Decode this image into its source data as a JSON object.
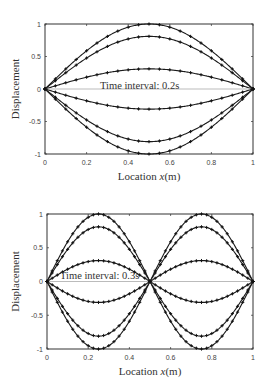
{
  "chart_data": [
    {
      "type": "line",
      "title": "",
      "annotation": "Time interval: 0.2s",
      "xlabel": "Location x(m)",
      "ylabel": "Displacement",
      "xlim": [
        0,
        1
      ],
      "ylim": [
        -1,
        1
      ],
      "xticks": [
        "0",
        "0.2",
        "0.4",
        "0.6",
        "0.8",
        "1"
      ],
      "yticks": [
        "-1",
        "-0.5",
        "0",
        "0.5",
        "1"
      ],
      "grid": false,
      "legend": null,
      "mode": 1,
      "function": "A*sin(pi*x)",
      "marker": "+",
      "series": [
        {
          "name": "t=0.0s",
          "amplitude": 1.0
        },
        {
          "name": "t=0.2s",
          "amplitude": 0.81
        },
        {
          "name": "t=0.4s",
          "amplitude": 0.31
        },
        {
          "name": "t=0.5s",
          "amplitude": 0.0
        },
        {
          "name": "t=0.6s",
          "amplitude": -0.31
        },
        {
          "name": "t=0.8s",
          "amplitude": -0.81
        },
        {
          "name": "t=1.0s",
          "amplitude": -1.0
        }
      ],
      "x": [
        0,
        0.05,
        0.1,
        0.15,
        0.2,
        0.25,
        0.3,
        0.35,
        0.4,
        0.45,
        0.5,
        0.55,
        0.6,
        0.65,
        0.7,
        0.75,
        0.8,
        0.85,
        0.9,
        0.95,
        1.0
      ]
    },
    {
      "type": "line",
      "title": "",
      "annotation": "Time interval: 0.3s",
      "xlabel": "Location x(m)",
      "ylabel": "Displacement",
      "xlim": [
        0,
        1
      ],
      "ylim": [
        -1,
        1
      ],
      "xticks": [
        "0",
        "0.2",
        "0.4",
        "0.6",
        "0.8",
        "1"
      ],
      "yticks": [
        "-1",
        "-0.5",
        "0",
        "0.5",
        "1"
      ],
      "grid": false,
      "legend": null,
      "mode": 2,
      "function": "A*sin(2*pi*x)",
      "marker": "+",
      "series": [
        {
          "name": "t=0.0s",
          "amplitude": 1.0
        },
        {
          "name": "t=0.3s",
          "amplitude": 0.81
        },
        {
          "name": "t=0.6s",
          "amplitude": 0.31
        },
        {
          "name": "t=0.75s",
          "amplitude": 0.0
        },
        {
          "name": "t=0.9s",
          "amplitude": -0.31
        },
        {
          "name": "t=1.2s",
          "amplitude": -0.81
        },
        {
          "name": "t=1.5s",
          "amplitude": -1.0
        }
      ],
      "x": [
        0,
        0.025,
        0.05,
        0.075,
        0.1,
        0.125,
        0.15,
        0.175,
        0.2,
        0.225,
        0.25,
        0.275,
        0.3,
        0.325,
        0.35,
        0.375,
        0.4,
        0.425,
        0.45,
        0.475,
        0.5,
        0.525,
        0.55,
        0.575,
        0.6,
        0.625,
        0.65,
        0.675,
        0.7,
        0.725,
        0.75,
        0.775,
        0.8,
        0.825,
        0.85,
        0.875,
        0.9,
        0.925,
        0.95,
        0.975,
        1.0
      ]
    }
  ],
  "cut_title_text": "Fig..."
}
